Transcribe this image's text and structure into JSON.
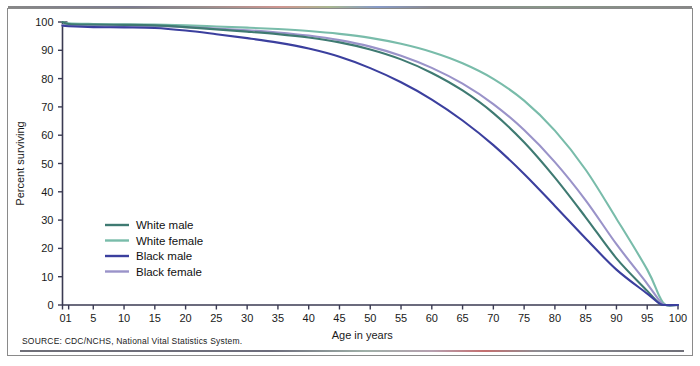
{
  "figure": {
    "source_note": "SOURCE: CDC/NCHS, National Vital Statistics System."
  },
  "colors": {
    "white_male": "#3f7a72",
    "white_female": "#79bcaa",
    "black_male": "#3b3f9e",
    "black_female": "#9a93c9",
    "axis": "#3a3a52",
    "frame": "#8a8a8a",
    "text": "#1a1a1a"
  },
  "chart_data": {
    "type": "line",
    "title": "",
    "subtitle": "",
    "xlabel": "Age in years",
    "ylabel": "Percent surviving",
    "xlim": [
      0,
      100
    ],
    "ylim": [
      0,
      100
    ],
    "grid": false,
    "legend_position": "inner-left",
    "x_tick_labels": [
      "0",
      "1",
      "5",
      "10",
      "15",
      "20",
      "25",
      "30",
      "35",
      "40",
      "45",
      "50",
      "55",
      "60",
      "65",
      "70",
      "75",
      "80",
      "85",
      "90",
      "95",
      "100"
    ],
    "x_tick_values": [
      0,
      1,
      5,
      10,
      15,
      20,
      25,
      30,
      35,
      40,
      45,
      50,
      55,
      60,
      65,
      70,
      75,
      80,
      85,
      90,
      95,
      100
    ],
    "y_tick_labels": [
      "0",
      "10",
      "20",
      "30",
      "40",
      "50",
      "60",
      "70",
      "80",
      "90",
      "100"
    ],
    "y_tick_values": [
      0,
      10,
      20,
      30,
      40,
      50,
      60,
      70,
      80,
      90,
      100
    ],
    "x": [
      0,
      1,
      5,
      10,
      15,
      20,
      25,
      30,
      35,
      40,
      45,
      50,
      55,
      60,
      65,
      70,
      75,
      80,
      85,
      90,
      95,
      97,
      98,
      100
    ],
    "series": [
      {
        "name": "White male",
        "color": "#3f7a72",
        "values": [
          100,
          99.3,
          99.1,
          99.0,
          98.8,
          98.2,
          97.4,
          96.6,
          95.7,
          94.5,
          92.8,
          90.3,
          86.8,
          82.0,
          75.8,
          67.8,
          57.5,
          45.0,
          31.0,
          16.5,
          5.0,
          0.5,
          0,
          0
        ]
      },
      {
        "name": "White female",
        "color": "#79bcaa",
        "values": [
          100,
          99.5,
          99.3,
          99.2,
          99.1,
          98.8,
          98.4,
          98.0,
          97.5,
          96.8,
          95.8,
          94.4,
          92.3,
          89.4,
          85.4,
          79.9,
          72.2,
          61.6,
          47.8,
          30.5,
          12.5,
          3.0,
          0,
          0
        ]
      },
      {
        "name": "Black male",
        "color": "#3b3f9e",
        "values": [
          98.7,
          98.5,
          98.2,
          98.1,
          97.9,
          97.0,
          95.7,
          94.3,
          92.7,
          90.6,
          87.7,
          83.7,
          78.7,
          72.6,
          65.2,
          56.5,
          46.3,
          35.0,
          23.5,
          12.5,
          4.0,
          0.5,
          0,
          0
        ]
      },
      {
        "name": "Black female",
        "color": "#9a93c9",
        "values": [
          98.9,
          98.8,
          98.7,
          98.6,
          98.5,
          98.2,
          97.7,
          97.1,
          96.3,
          95.2,
          93.6,
          91.3,
          88.1,
          83.8,
          78.2,
          71.0,
          61.8,
          50.5,
          37.0,
          21.5,
          7.5,
          1.5,
          0,
          0
        ]
      }
    ],
    "legend": [
      {
        "label": "White male",
        "color": "#3f7a72"
      },
      {
        "label": "White female",
        "color": "#79bcaa"
      },
      {
        "label": "Black male",
        "color": "#3b3f9e"
      },
      {
        "label": "Black female",
        "color": "#9a93c9"
      }
    ]
  }
}
